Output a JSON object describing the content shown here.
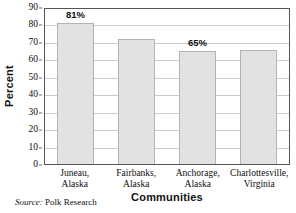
{
  "chart_data": {
    "type": "bar",
    "title": "",
    "subtitle": "",
    "xlabel": "Communities",
    "ylabel": "Percent",
    "categories": [
      "Juneau, Alaska",
      "Fairbanks, Alaska",
      "Anchorage, Alaska",
      "Charlottesville, Virginia"
    ],
    "category_lines": [
      [
        "Juneau,",
        "Alaska"
      ],
      [
        "Fairbanks,",
        "Alaska"
      ],
      [
        "Anchorage,",
        "Alaska"
      ],
      [
        "Charlottesville,",
        "Virginia"
      ]
    ],
    "values": [
      81,
      71.5,
      65,
      65.5
    ],
    "data_labels": [
      "81%",
      "",
      "65%",
      ""
    ],
    "ylim": [
      0,
      90
    ],
    "ytick_values": [
      90,
      80,
      70,
      60,
      50,
      40,
      30,
      20,
      10,
      0
    ],
    "ytick_labels": [
      "90",
      "80",
      "70",
      "60",
      "50",
      "40",
      "30",
      "20",
      "10",
      "0"
    ],
    "grid": "horizontal",
    "legend": "none",
    "bar_fill_color": "#e2e2e2",
    "bar_border_color": "#b4b4b4",
    "gridline_color": "#c9c9c9",
    "axis_color": "#555555",
    "annotations": [
      {
        "text": "81%",
        "series_index": 0
      },
      {
        "text": "65%",
        "series_index": 2
      }
    ]
  },
  "footer": {
    "source_key": "Source:",
    "source_value": "Polk Research"
  }
}
